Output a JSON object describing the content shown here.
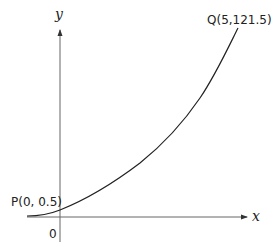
{
  "diagram": {
    "type": "function-graph",
    "axes": {
      "x_label": "x",
      "y_label": "y",
      "origin_label": "0"
    },
    "points": {
      "P": {
        "label": "P(0, 0.5)",
        "x": 0,
        "y": 0.5
      },
      "Q": {
        "label": "Q(5,121.5)",
        "x": 5,
        "y": 121.5
      }
    },
    "curve": {
      "description": "Increasing curve flattening toward the negative x-axis, passing through P and Q",
      "color": "#222222"
    },
    "colors": {
      "axis": "#555555",
      "curve": "#222222",
      "text": "#222222",
      "background": "#ffffff"
    }
  }
}
